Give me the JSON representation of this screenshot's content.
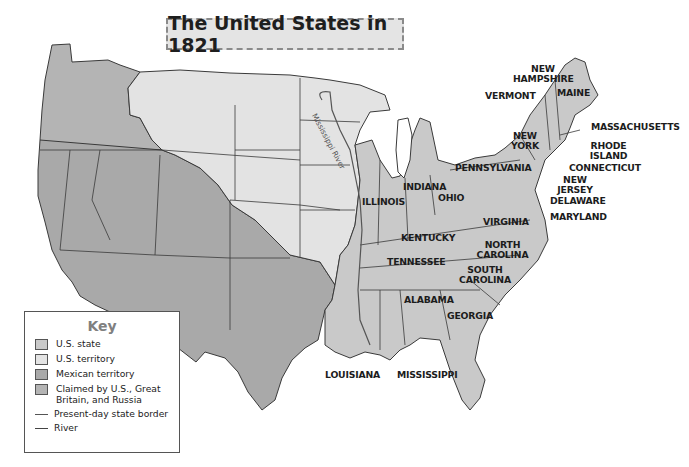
{
  "title": "The United States in 1821",
  "colors": {
    "us_state": "#c9c9c9",
    "us_territory": "#e3e3e3",
    "mexican_territory": "#a9a9a9",
    "claimed": "#b4b4b4",
    "border": "#3a3a3a",
    "background": "#ffffff"
  },
  "key": {
    "title": "Key",
    "items": [
      {
        "label": "U.S. state",
        "type": "swatch",
        "color": "#c9c9c9"
      },
      {
        "label": "U.S. territory",
        "type": "swatch",
        "color": "#e3e3e3"
      },
      {
        "label": "Mexican territory",
        "type": "swatch",
        "color": "#a9a9a9"
      },
      {
        "label": "Claimed by U.S., Great Britain, and Russia",
        "type": "swatch",
        "color": "#b4b4b4"
      },
      {
        "label": "Present-day state border",
        "type": "line"
      },
      {
        "label": "River",
        "type": "river"
      }
    ]
  },
  "labels": {
    "new_hampshire": "NEW HAMPSHIRE",
    "vermont": "VERMONT",
    "maine": "MAINE",
    "massachusetts": "MASSACHUSETTS",
    "new_york": "NEW YORK",
    "rhode_island": "RHODE ISLAND",
    "connecticut": "CONNECTICUT",
    "pennsylvania": "PENNSYLVANIA",
    "new_jersey": "NEW JERSEY",
    "delaware": "DELAWARE",
    "maryland": "MARYLAND",
    "indiana": "INDIANA",
    "ohio": "OHIO",
    "illinois": "ILLINOIS",
    "virginia": "VIRGINIA",
    "kentucky": "KENTUCKY",
    "north_carolina": "NORTH CAROLINA",
    "tennessee": "TENNESSEE",
    "south_carolina": "SOUTH CAROLINA",
    "alabama": "ALABAMA",
    "georgia": "GEORGIA",
    "louisiana": "LOUISIANA",
    "mississippi": "MISSISSIPPI",
    "mississippi_river": "Mississippi River"
  }
}
